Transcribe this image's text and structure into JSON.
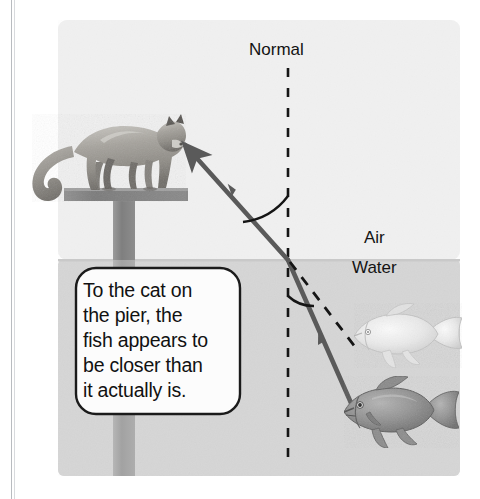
{
  "figure": {
    "labels": {
      "normal": "Normal",
      "air": "Air",
      "water": "Water"
    },
    "callout": {
      "text": "To the cat on the pier, the fish appears to be closer than it actually is.",
      "lines": [
        "To the cat on",
        "the pier, the",
        "fish appears to",
        "be closer than",
        "it actually is."
      ]
    },
    "objects": {
      "cat": "cat-standing-on-pier",
      "pier": "wooden-pier-post",
      "real_fish": "real-fish-dark",
      "apparent_fish": "apparent-fish-light"
    },
    "rays": {
      "incident": "solid-ray-from-water-surface-to-cat-eye",
      "refracted": "solid-ray-from-surface-down-to-real-fish",
      "apparent": "dashed-ray-from-surface-to-apparent-fish",
      "normal_line": "vertical-dashed-normal-at-boundary"
    },
    "colors": {
      "air": "#f1f1f1",
      "water": "#d6d6d6",
      "page": "#ffffff",
      "ray": "#5a5a5a",
      "line": "#1a1a1a",
      "pier": "#8b8b8b",
      "text": "#131313"
    }
  }
}
